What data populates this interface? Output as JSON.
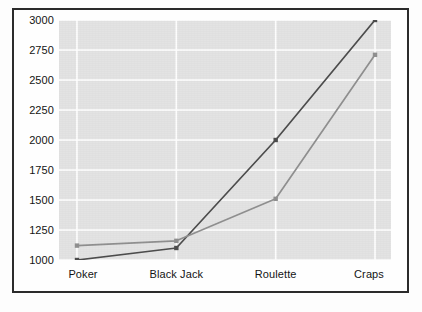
{
  "chart_data": {
    "type": "line",
    "title": "",
    "subtitle": "",
    "xlabel": "",
    "ylabel": "",
    "categories": [
      "Poker",
      "Black Jack",
      "Roulette",
      "Craps"
    ],
    "ylim": [
      1000,
      3000
    ],
    "yticks": [
      1000,
      1250,
      1500,
      1750,
      2000,
      2250,
      2500,
      2750,
      3000
    ],
    "ytick_labels": [
      "1000",
      "1250",
      "1500",
      "1750",
      "2000",
      "2250",
      "2500",
      "2750",
      "3000"
    ],
    "grid": true,
    "grid_color": "#ffffff",
    "plot_background": "#e3e3e3",
    "legend": false,
    "legend_position": "none",
    "series": [
      {
        "name": "series-1",
        "color": "#4d4d4d",
        "marker": "square",
        "values": [
          1000,
          1100,
          2000,
          3000
        ]
      },
      {
        "name": "series-2",
        "color": "#909090",
        "marker": "square",
        "values": [
          1120,
          1160,
          1510,
          2710
        ]
      }
    ]
  },
  "axes": {
    "y_labels": [
      "3000",
      "2750",
      "2500",
      "2250",
      "2000",
      "1750",
      "1500",
      "1250",
      "1000"
    ],
    "x_labels": [
      "Poker",
      "Black Jack",
      "Roulette",
      "Craps"
    ]
  },
  "colors": {
    "frame_border": "#2b2b2b",
    "plot_bg": "#e3e3e3",
    "gridline": "#ffffff",
    "series_dark": "#4d4d4d",
    "series_light": "#909090",
    "text": "#141414",
    "page_bg": "#fdfdfd"
  }
}
